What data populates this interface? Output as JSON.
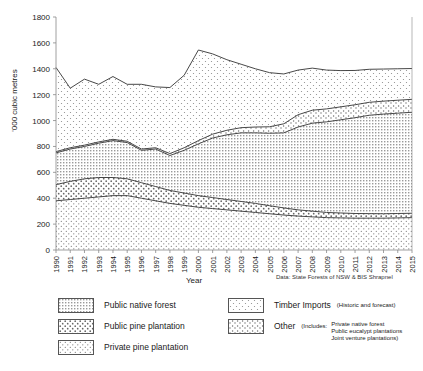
{
  "chart_data": {
    "type": "area",
    "title": "",
    "xlabel": "Year",
    "ylabel": "'000 cubic metres",
    "ylim": [
      0,
      1800
    ],
    "ytick_step": 200,
    "yticks": [
      0,
      200,
      400,
      600,
      800,
      1000,
      1200,
      1400,
      1600,
      1800
    ],
    "grid": false,
    "stacked": true,
    "legend_position": "below",
    "source_note": "Data: State Forests of NSW & BIS Shrapnel",
    "categories": [
      "1990",
      "1991",
      "1992",
      "1993",
      "1994",
      "1995",
      "1996",
      "1997",
      "1998",
      "1999",
      "2000",
      "2001",
      "2002",
      "2003",
      "2004",
      "2005",
      "2006",
      "2007",
      "2008",
      "2009",
      "2010",
      "2011",
      "2012",
      "2013",
      "2014",
      "2015"
    ],
    "series": [
      {
        "name": "Private pine plantation",
        "pattern": "sparse-dots",
        "values": [
          380,
          390,
          400,
          410,
          420,
          420,
          400,
          380,
          360,
          345,
          330,
          320,
          310,
          300,
          290,
          280,
          270,
          262,
          256,
          250,
          248,
          246,
          246,
          246,
          248,
          250
        ]
      },
      {
        "name": "Public pine plantation",
        "pattern": "cross-dots",
        "values": [
          125,
          140,
          150,
          150,
          140,
          130,
          120,
          110,
          100,
          95,
          90,
          85,
          80,
          75,
          70,
          62,
          55,
          48,
          44,
          40,
          38,
          36,
          35,
          34,
          34,
          34
        ]
      },
      {
        "name": "Public native forest",
        "pattern": "fine-grid",
        "values": [
          245,
          250,
          250,
          265,
          285,
          280,
          250,
          290,
          270,
          330,
          400,
          460,
          500,
          530,
          545,
          560,
          580,
          640,
          680,
          700,
          720,
          740,
          760,
          770,
          775,
          780
        ]
      },
      {
        "name": "Other",
        "pattern": "scattered-dots",
        "values": [
          10,
          10,
          10,
          10,
          10,
          10,
          10,
          10,
          15,
          20,
          25,
          30,
          35,
          40,
          45,
          50,
          70,
          95,
          100,
          100,
          100,
          100,
          100,
          100,
          100,
          100
        ]
      },
      {
        "name": "Timber Imports",
        "pattern": "open-dots",
        "values": [
          650,
          460,
          510,
          445,
          485,
          440,
          500,
          470,
          510,
          560,
          700,
          620,
          545,
          490,
          450,
          418,
          385,
          345,
          325,
          300,
          280,
          265,
          255,
          248,
          243,
          238
        ]
      }
    ],
    "totals": [
      1410,
      1250,
      1320,
      1280,
      1340,
      1280,
      1280,
      1260,
      1255,
      1350,
      1545,
      1515,
      1470,
      1435,
      1400,
      1370,
      1360,
      1390,
      1405,
      1390,
      1386,
      1387,
      1396,
      1398,
      1400,
      1402
    ]
  },
  "legend": {
    "items": [
      {
        "label": "Public native forest",
        "pattern": "fine-grid",
        "note": "",
        "sub_lines": []
      },
      {
        "label": "Public pine plantation",
        "pattern": "cross-dots",
        "note": "",
        "sub_lines": []
      },
      {
        "label": "Private pine plantation",
        "pattern": "sparse-dots",
        "note": "",
        "sub_lines": []
      },
      {
        "label": "Timber Imports",
        "pattern": "open-dots",
        "note": "(Historic and forecast)",
        "sub_lines": []
      },
      {
        "label": "Other",
        "pattern": "scattered-dots",
        "note": "(Includes:",
        "sub_lines": [
          "Private native forest",
          "Public eucalypt plantations",
          "Joint venture plantations)"
        ]
      }
    ]
  },
  "colors": {
    "line": "#333333",
    "axis": "#888888",
    "text": "#1a1a1a",
    "background": "#ffffff"
  }
}
